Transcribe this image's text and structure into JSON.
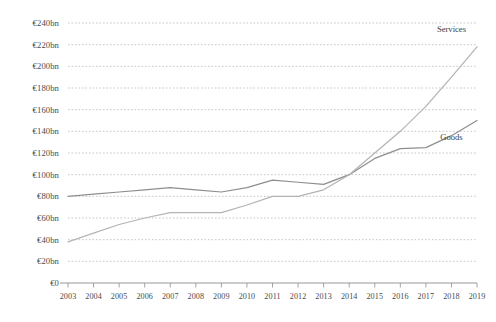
{
  "chart_data": {
    "type": "line",
    "title": "",
    "subtitle": "",
    "xlabel": "",
    "ylabel": "",
    "grid": true,
    "legend_position": "inline-right",
    "x": [
      2003,
      2004,
      2005,
      2006,
      2007,
      2008,
      2009,
      2010,
      2011,
      2012,
      2013,
      2014,
      2015,
      2016,
      2017,
      2018,
      2019
    ],
    "categories": [
      "2003",
      "2004",
      "2005",
      "2006",
      "2007",
      "2008",
      "2009",
      "2010",
      "2011",
      "2012",
      "2013",
      "2014",
      "2015",
      "2016",
      "2017",
      "2018",
      "2019"
    ],
    "ylim": [
      0,
      240
    ],
    "xlim": [
      2003,
      2019
    ],
    "ytick_values": [
      0,
      20,
      40,
      60,
      80,
      100,
      120,
      140,
      160,
      180,
      200,
      220,
      240
    ],
    "ytick_labels": [
      "€0",
      "€20bn",
      "€40bn",
      "€60bn",
      "€80bn",
      "€100bn",
      "€120bn",
      "€140bn",
      "€160bn",
      "€180bn",
      "€200bn",
      "€220bn",
      "€240bn"
    ],
    "currency_symbol": "€",
    "unit": "bn",
    "series": [
      {
        "name": "Goods",
        "color": "#8e8e8e",
        "label_x": 2018,
        "label_y": 132,
        "values": [
          80,
          82,
          84,
          86,
          88,
          86,
          84,
          88,
          95,
          93,
          91,
          100,
          115,
          124,
          125,
          136,
          150
        ]
      },
      {
        "name": "Services",
        "color": "#b4b4b4",
        "label_x": 2018,
        "label_y": 232,
        "values": [
          38,
          46,
          54,
          60,
          65,
          65,
          65,
          72,
          80,
          80,
          86,
          100,
          120,
          140,
          163,
          190,
          218
        ]
      }
    ]
  },
  "axis": {
    "y_label_suffix": "bn",
    "x_axis_name": "year-axis",
    "y_axis_name": "value-axis"
  }
}
